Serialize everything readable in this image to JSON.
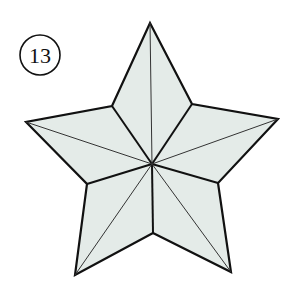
{
  "diagram": {
    "step_label": "13",
    "colors": {
      "fill": "#e4ebe8",
      "outline": "#111111",
      "crease": "#333333",
      "background": "#ffffff"
    },
    "star": {
      "center": [
        152,
        164
      ],
      "outer_points": [
        [
          150,
          23
        ],
        [
          278,
          119
        ],
        [
          231,
          272
        ],
        [
          75,
          275
        ],
        [
          26,
          122
        ]
      ],
      "inner_points": [
        [
          192,
          104
        ],
        [
          218,
          183
        ],
        [
          153,
          233
        ],
        [
          87,
          184
        ],
        [
          112,
          106
        ]
      ]
    }
  }
}
